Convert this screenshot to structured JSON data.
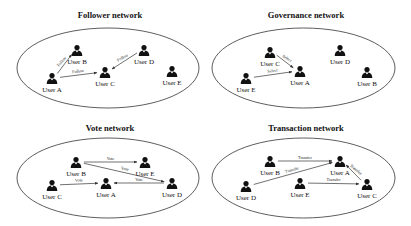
{
  "panels": [
    {
      "id": "follower",
      "title": "Follower network",
      "users": [
        {
          "id": "A",
          "label": "User A"
        },
        {
          "id": "B",
          "label": "User B"
        },
        {
          "id": "C",
          "label": "User C"
        },
        {
          "id": "D",
          "label": "User D"
        },
        {
          "id": "E",
          "label": "User E"
        }
      ],
      "edges": [
        {
          "from": "A",
          "to": "B",
          "label": "Follow"
        },
        {
          "from": "A",
          "to": "C",
          "label": "Follow"
        },
        {
          "from": "D",
          "to": "C",
          "label": "Follow"
        }
      ]
    },
    {
      "id": "governance",
      "title": "Governance network",
      "users": [
        {
          "id": "A",
          "label": "User A"
        },
        {
          "id": "B",
          "label": "User B"
        },
        {
          "id": "C",
          "label": "User C"
        },
        {
          "id": "D",
          "label": "User D"
        },
        {
          "id": "E",
          "label": "User E"
        }
      ],
      "edges": [
        {
          "from": "C",
          "to": "A",
          "label": "Select"
        },
        {
          "from": "E",
          "to": "A",
          "label": "Select"
        }
      ]
    },
    {
      "id": "vote",
      "title": "Vote network",
      "users": [
        {
          "id": "A",
          "label": "User A"
        },
        {
          "id": "B",
          "label": "User B"
        },
        {
          "id": "C",
          "label": "User C"
        },
        {
          "id": "D",
          "label": "User D"
        },
        {
          "id": "E",
          "label": "User E"
        }
      ],
      "edges": [
        {
          "from": "B",
          "to": "E",
          "label": "Vote"
        },
        {
          "from": "B",
          "to": "D",
          "label": "Vote"
        },
        {
          "from": "C",
          "to": "A",
          "label": "Vote"
        },
        {
          "from": "D",
          "to": "A",
          "label": "Vote"
        }
      ]
    },
    {
      "id": "transaction",
      "title": "Transaction network",
      "users": [
        {
          "id": "A",
          "label": "User A"
        },
        {
          "id": "B",
          "label": "User B"
        },
        {
          "id": "C",
          "label": "User C"
        },
        {
          "id": "D",
          "label": "User D"
        },
        {
          "id": "E",
          "label": "User E"
        }
      ],
      "edges": [
        {
          "from": "B",
          "to": "A",
          "label": "Transfer"
        },
        {
          "from": "D",
          "to": "A",
          "label": "Transfer"
        },
        {
          "from": "C",
          "to": "A",
          "label": "Transfer"
        },
        {
          "from": "E",
          "to": "C",
          "label": "Transfer"
        }
      ]
    }
  ]
}
